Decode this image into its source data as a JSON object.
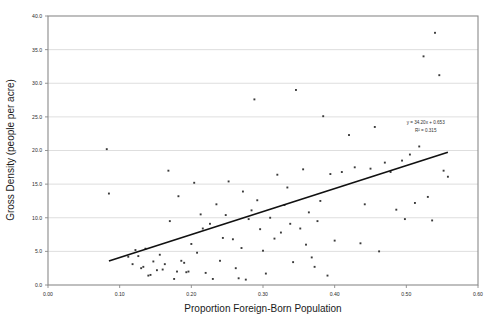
{
  "figure": {
    "background_color": "#ffffff",
    "plot_area": {
      "left": 48,
      "top": 16,
      "right": 478,
      "bottom": 285
    }
  },
  "colors": {
    "point": "#3a3a3a",
    "trendline": "#111111",
    "gridline": "#d5d5d5",
    "frame": "#8a8a8a",
    "text": "#1a1a1a"
  },
  "chart_data": {
    "type": "scatter",
    "title": "",
    "xlabel": "Proportion Foreign-Born Population",
    "ylabel": "Gross Density (people per acre)",
    "xlim": [
      0.0,
      0.6
    ],
    "ylim": [
      0.0,
      40.0
    ],
    "xticks": [
      0.0,
      0.1,
      0.2,
      0.3,
      0.4,
      0.5,
      0.6
    ],
    "xtick_labels": [
      "0.00",
      "0.10",
      "0.20",
      "0.30",
      "0.40",
      "0.50",
      "0.60"
    ],
    "yticks": [
      0.0,
      5.0,
      10.0,
      15.0,
      20.0,
      25.0,
      30.0,
      35.0,
      40.0
    ],
    "ytick_labels": [
      "0.0",
      "5.0",
      "10.0",
      "15.0",
      "20.0",
      "25.0",
      "30.0",
      "35.0",
      "40.0"
    ],
    "grid": "horizontal",
    "legend": "none",
    "annotations": [
      {
        "name": "regression-equation",
        "text": "y = 34.20x + 0.653",
        "x": 0.527,
        "y": 23.9
      },
      {
        "name": "r-squared",
        "text": "R² = 0.315",
        "x": 0.527,
        "y": 22.7
      }
    ],
    "trendline": {
      "type": "linear",
      "slope": 34.2,
      "intercept": 0.653,
      "equation": "y = 34.20x + 0.653",
      "r_squared": 0.315,
      "x_start": 0.085,
      "x_end": 0.558
    },
    "series": [
      {
        "name": "cities",
        "marker": "square",
        "points": [
          [
            0.082,
            20.2
          ],
          [
            0.085,
            13.6
          ],
          [
            0.112,
            4.2
          ],
          [
            0.118,
            3.1
          ],
          [
            0.122,
            5.2
          ],
          [
            0.126,
            4.3
          ],
          [
            0.13,
            2.5
          ],
          [
            0.133,
            2.7
          ],
          [
            0.136,
            5.4
          ],
          [
            0.14,
            1.4
          ],
          [
            0.143,
            1.5
          ],
          [
            0.147,
            3.5
          ],
          [
            0.152,
            2.2
          ],
          [
            0.156,
            4.5
          ],
          [
            0.16,
            2.3
          ],
          [
            0.163,
            3.1
          ],
          [
            0.168,
            17.0
          ],
          [
            0.17,
            9.5
          ],
          [
            0.176,
            0.9
          ],
          [
            0.18,
            2.0
          ],
          [
            0.182,
            13.2
          ],
          [
            0.186,
            3.6
          ],
          [
            0.19,
            3.3
          ],
          [
            0.193,
            1.9
          ],
          [
            0.196,
            2.0
          ],
          [
            0.2,
            6.1
          ],
          [
            0.204,
            15.2
          ],
          [
            0.208,
            4.8
          ],
          [
            0.213,
            10.5
          ],
          [
            0.216,
            8.4
          ],
          [
            0.22,
            1.8
          ],
          [
            0.226,
            9.1
          ],
          [
            0.23,
            0.9
          ],
          [
            0.235,
            12.0
          ],
          [
            0.24,
            3.6
          ],
          [
            0.244,
            7.0
          ],
          [
            0.248,
            10.4
          ],
          [
            0.252,
            15.4
          ],
          [
            0.258,
            6.8
          ],
          [
            0.262,
            2.5
          ],
          [
            0.266,
            1.0
          ],
          [
            0.27,
            5.5
          ],
          [
            0.272,
            13.9
          ],
          [
            0.276,
            0.8
          ],
          [
            0.28,
            9.8
          ],
          [
            0.284,
            11.1
          ],
          [
            0.288,
            27.6
          ],
          [
            0.292,
            12.6
          ],
          [
            0.296,
            8.3
          ],
          [
            0.3,
            5.1
          ],
          [
            0.304,
            1.7
          ],
          [
            0.31,
            10.0
          ],
          [
            0.316,
            6.9
          ],
          [
            0.32,
            16.4
          ],
          [
            0.325,
            7.8
          ],
          [
            0.33,
            11.9
          ],
          [
            0.334,
            14.5
          ],
          [
            0.338,
            9.1
          ],
          [
            0.342,
            3.4
          ],
          [
            0.346,
            29.0
          ],
          [
            0.352,
            8.4
          ],
          [
            0.356,
            17.2
          ],
          [
            0.36,
            6.0
          ],
          [
            0.364,
            10.8
          ],
          [
            0.368,
            4.1
          ],
          [
            0.372,
            2.7
          ],
          [
            0.376,
            9.5
          ],
          [
            0.38,
            12.5
          ],
          [
            0.384,
            25.1
          ],
          [
            0.39,
            1.4
          ],
          [
            0.394,
            16.5
          ],
          [
            0.4,
            6.6
          ],
          [
            0.41,
            16.8
          ],
          [
            0.42,
            22.3
          ],
          [
            0.428,
            17.5
          ],
          [
            0.436,
            6.2
          ],
          [
            0.442,
            12.0
          ],
          [
            0.45,
            17.3
          ],
          [
            0.456,
            23.5
          ],
          [
            0.462,
            5.0
          ],
          [
            0.47,
            18.2
          ],
          [
            0.478,
            16.8
          ],
          [
            0.486,
            11.2
          ],
          [
            0.494,
            18.5
          ],
          [
            0.498,
            9.8
          ],
          [
            0.505,
            19.4
          ],
          [
            0.512,
            12.2
          ],
          [
            0.518,
            20.6
          ],
          [
            0.524,
            34.0
          ],
          [
            0.53,
            13.1
          ],
          [
            0.536,
            9.6
          ],
          [
            0.54,
            37.5
          ],
          [
            0.546,
            31.2
          ],
          [
            0.552,
            17.0
          ],
          [
            0.558,
            16.1
          ]
        ]
      }
    ]
  }
}
